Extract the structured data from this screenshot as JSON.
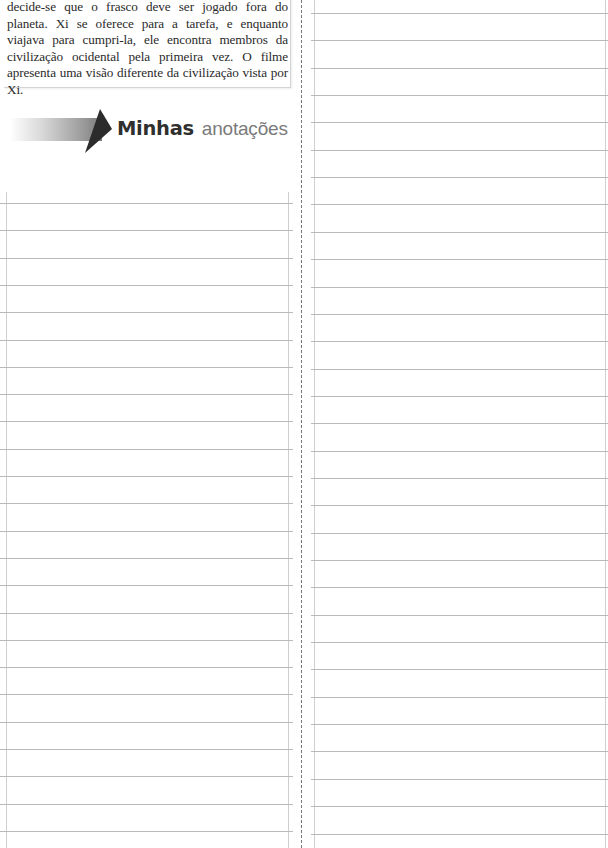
{
  "textbox": {
    "paragraph": "decide-se que o frasco deve ser jogado fora do planeta. Xi se oferece para a tarefa, e enquanto viajava para cumpri-la, ele encontra membros da civilização ocidental pela primeira vez. O filme apresenta uma visão diferente da civilização vista por Xi."
  },
  "heading": {
    "bold": "Minhas",
    "light": "anotações",
    "icon": "arrow-banner-icon"
  },
  "notes_left": {
    "line_count": 24,
    "first_line_y": 203,
    "spacing": 27.3
  },
  "notes_right": {
    "line_count": 31,
    "first_line_y": 13,
    "spacing": 27.35
  },
  "colors": {
    "text": "#2a2a2a",
    "rule": "#b9b9b9",
    "separator": "#777777",
    "title_bold": "#2f2f2f",
    "title_light": "#7a7a7a"
  }
}
